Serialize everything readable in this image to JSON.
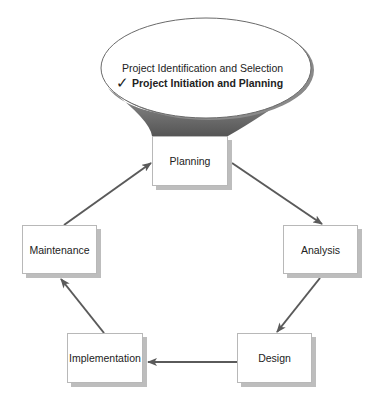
{
  "callout": {
    "items": [
      {
        "label": "Project Identification and Selection",
        "checked": false
      },
      {
        "label": "Project Initiation and Planning",
        "checked": true
      }
    ],
    "check_glyph": "✓"
  },
  "nodes": {
    "planning": "Planning",
    "analysis": "Analysis",
    "design": "Design",
    "implementation": "Implementation",
    "maintenance": "Maintenance"
  },
  "edges": [
    {
      "from": "Planning",
      "to": "Analysis"
    },
    {
      "from": "Analysis",
      "to": "Design"
    },
    {
      "from": "Design",
      "to": "Implementation"
    },
    {
      "from": "Implementation",
      "to": "Maintenance"
    },
    {
      "from": "Maintenance",
      "to": "Planning"
    }
  ],
  "colors": {
    "arrow": "#5a5a5a",
    "box_border": "#b8b8b8",
    "shadow": "#bdbdbd",
    "funnel": "#6e6e6e"
  }
}
